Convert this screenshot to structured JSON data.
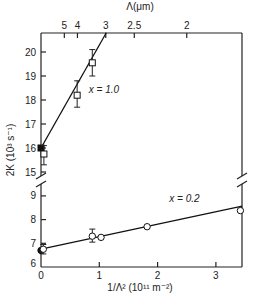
{
  "chart_data": {
    "type": "scatter",
    "title": "",
    "xlabel": "1/Λ² (10¹¹ m⁻²)",
    "ylabel": "2K (10³ s⁻¹)",
    "top_xlabel": "Λ(μm)",
    "xlim": [
      0,
      3.45
    ],
    "ylim_upper_panel": [
      15,
      20.8
    ],
    "ylim_lower_panel": [
      6,
      9.4
    ],
    "axis_break": "between 15 and 9 on y-axis (both left and right spines)",
    "grid": false,
    "x_ticks": [
      0,
      1,
      2,
      3
    ],
    "y_ticks_upper": [
      15,
      16,
      17,
      18,
      19,
      20
    ],
    "y_ticks_lower": [
      6,
      7,
      8,
      9
    ],
    "top_ticks": [
      {
        "label": "5",
        "x": 0.4
      },
      {
        "label": "4",
        "x": 0.625
      },
      {
        "label": "3",
        "x": 1.111
      },
      {
        "label": "2.5",
        "x": 1.6
      },
      {
        "label": "2",
        "x": 2.5
      }
    ],
    "series": [
      {
        "name": "x = 1.0",
        "panel": "upper",
        "marker": "square",
        "fit_line": {
          "x0": 0,
          "y0": 16.0,
          "x1": 1.12,
          "y1": 20.8
        },
        "points": [
          {
            "x": 0.0,
            "y": 16.0,
            "filled": true
          },
          {
            "x": 0.05,
            "y": 15.75,
            "filled": false,
            "err": [
              15.3,
              16.1
            ]
          },
          {
            "x": 0.62,
            "y": 18.2,
            "filled": false,
            "err": [
              17.7,
              18.8
            ]
          },
          {
            "x": 0.88,
            "y": 19.55,
            "filled": false,
            "err": [
              19.0,
              20.1
            ]
          }
        ],
        "label_pos": {
          "x": 0.82,
          "y": 18.3
        }
      },
      {
        "name": "x = 0.2",
        "panel": "lower",
        "marker": "circle",
        "fit_line": {
          "x0": 0,
          "y0": 6.75,
          "x1": 3.45,
          "y1": 8.57
        },
        "points": [
          {
            "x": 0.0,
            "y": 6.7,
            "filled": true
          },
          {
            "x": 0.04,
            "y": 6.75,
            "filled": false,
            "err": [
              6.55,
              6.95
            ]
          },
          {
            "x": 0.88,
            "y": 7.3,
            "filled": false,
            "err": [
              7.05,
              7.6
            ]
          },
          {
            "x": 1.03,
            "y": 7.25,
            "filled": false
          },
          {
            "x": 1.82,
            "y": 7.7,
            "filled": false
          },
          {
            "x": 3.42,
            "y": 8.38,
            "filled": false
          }
        ],
        "label_pos": {
          "x": 2.2,
          "y": 8.75
        }
      }
    ]
  },
  "labels": {
    "xlabel": "1/Λ² (10¹¹ m⁻²)",
    "ylabel": "2K (10³ s⁻¹)",
    "top_xlabel": "Λ(μm)",
    "series_1": "x = 1.0",
    "series_2": "x = 0.2"
  }
}
